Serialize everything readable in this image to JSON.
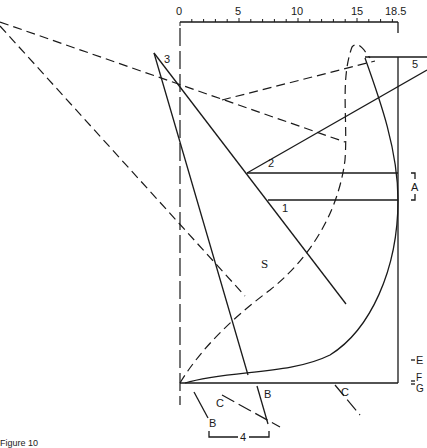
{
  "scale": {
    "ticks": [
      "0",
      "5",
      "10",
      "15",
      "18.5"
    ],
    "min": 0,
    "max": 18.5
  },
  "labels": {
    "line1": "1",
    "line2": "2",
    "line3": "3",
    "line4": "4",
    "line5": "5",
    "curve_s": "S",
    "bracket_a": "A",
    "mark_e": "E",
    "mark_f": "F",
    "mark_g": "G",
    "mark_b1": "B",
    "mark_b2": "B",
    "mark_c1": "C",
    "mark_c2": "C"
  },
  "caption": "Figure 10"
}
